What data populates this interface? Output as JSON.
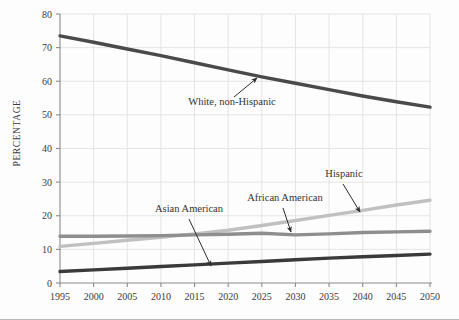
{
  "chart_data": {
    "type": "line",
    "title": "",
    "xlabel": "",
    "ylabel": "PERCENTAGE",
    "x": [
      1995,
      2000,
      2005,
      2010,
      2015,
      2020,
      2025,
      2030,
      2035,
      2040,
      2045,
      2050
    ],
    "xlim": [
      1995,
      2050
    ],
    "ylim": [
      0,
      80
    ],
    "xticks": [
      "1995",
      "2000",
      "2005",
      "2010",
      "2015",
      "2020",
      "2025",
      "2030",
      "2035",
      "2040",
      "2045",
      "2050"
    ],
    "yticks": [
      "0",
      "10",
      "20",
      "30",
      "40",
      "50",
      "60",
      "70",
      "80"
    ],
    "grid": true,
    "legend": "annotations-on-plot",
    "series": [
      {
        "name": "White, non-Hispanic",
        "color": "#4a4a4a",
        "values": [
          73.5,
          71.6,
          69.6,
          67.6,
          65.5,
          63.4,
          61.3,
          59.4,
          57.5,
          55.6,
          53.9,
          52.3
        ]
      },
      {
        "name": "Hispanic",
        "color": "#c0c0c0",
        "values": [
          10.9,
          11.8,
          12.7,
          13.6,
          14.6,
          15.7,
          17.1,
          18.6,
          20.1,
          21.6,
          23.2,
          24.6
        ]
      },
      {
        "name": "African American",
        "color": "#8e8e8e",
        "values": [
          13.9,
          13.9,
          14.0,
          14.1,
          14.3,
          14.5,
          14.8,
          14.3,
          14.6,
          15.0,
          15.2,
          15.4
        ]
      },
      {
        "name": "Asian American",
        "color": "#3a3a3a",
        "values": [
          3.4,
          3.9,
          4.4,
          4.9,
          5.4,
          5.9,
          6.4,
          6.9,
          7.4,
          7.8,
          8.2,
          8.6
        ]
      }
    ],
    "annotations": [
      {
        "label": "White, non-Hispanic",
        "x": 232,
        "y": 105,
        "arrow_from_x": 234,
        "arrow_from_y": 97,
        "arrow_to_x": 257,
        "arrow_to_y": 78
      },
      {
        "label": "Asian American",
        "x": 189,
        "y": 212,
        "arrow_from_x": 189,
        "arrow_from_y": 219,
        "arrow_to_x": 211,
        "arrow_to_y": 266
      },
      {
        "label": "African American",
        "x": 285,
        "y": 201,
        "arrow_from_x": 283,
        "arrow_from_y": 208,
        "arrow_to_x": 291,
        "arrow_to_y": 232
      },
      {
        "label": "Hispanic",
        "x": 344,
        "y": 177,
        "arrow_from_x": 343,
        "arrow_from_y": 184,
        "arrow_to_x": 360,
        "arrow_to_y": 212
      }
    ]
  },
  "axis": {
    "y_title": "PERCENTAGE"
  },
  "colors": {
    "grid": "#e4e4e4",
    "axis": "#8a8a8a",
    "tick_text": "#3b3b3b",
    "annotation_text": "#333333",
    "background": "#fdfdfd"
  }
}
